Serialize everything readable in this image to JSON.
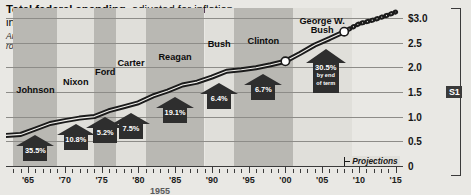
{
  "headline": {
    "bold_part": "Total federal spending,",
    "rest": " adjusted for inflation,",
    "line2": "in trillions"
  },
  "subnote": {
    "line1": "Arrows indicate amount that spending",
    "line2": "rose during each President’s term"
  },
  "axis": {
    "y_labels": [
      "$3.0",
      "2.5",
      "2.0",
      "1.5",
      "1.0",
      "0.5",
      "0"
    ],
    "y_values": [
      3.0,
      2.5,
      2.0,
      1.5,
      1.0,
      0.5,
      0
    ],
    "x_labels": [
      "'65",
      "'70",
      "'75",
      "'80",
      "'85",
      "'90",
      "'95",
      "'00",
      "'05",
      "'10",
      "'15"
    ],
    "x_values": [
      1965,
      1970,
      1975,
      1980,
      1985,
      1990,
      1995,
      2000,
      2005,
      2010,
      2015
    ]
  },
  "annotations": {
    "projections": "Projections",
    "section_label": "S1"
  },
  "colors": {
    "band_dark": "#b9b8b3",
    "band_light": "#e0dfda",
    "line": "#1b1b1b",
    "callout": "#2e2e2e",
    "background": "#e9e8e4"
  },
  "chart_data": {
    "type": "line",
    "title": "Total federal spending, adjusted for inflation, in trillions",
    "subtitle": "Arrows indicate amount that spending rose during each President's term",
    "xlabel": "",
    "ylabel": "Trillions of dollars",
    "xlim": [
      1962,
      2016
    ],
    "ylim": [
      0,
      3.2
    ],
    "grid": true,
    "legend": false,
    "x": [
      1962,
      1964,
      1966,
      1968,
      1970,
      1972,
      1974,
      1976,
      1978,
      1980,
      1982,
      1984,
      1986,
      1988,
      1990,
      1992,
      1994,
      1996,
      1998,
      2000,
      2002,
      2004,
      2006,
      2008,
      2010,
      2012,
      2014,
      2015
    ],
    "y": [
      0.62,
      0.64,
      0.75,
      0.86,
      0.92,
      0.97,
      1.0,
      1.12,
      1.2,
      1.28,
      1.42,
      1.52,
      1.64,
      1.7,
      1.8,
      1.92,
      1.95,
      1.99,
      2.05,
      2.12,
      2.28,
      2.45,
      2.58,
      2.72,
      2.88,
      2.96,
      3.06,
      3.12
    ],
    "projection_start_year": 2008,
    "presidents": [
      {
        "name": "Johnson",
        "pct": "35.5%",
        "start": 1963,
        "end": 1969,
        "band": "dark",
        "label_x": 1966.0,
        "label_y": 1.62,
        "arrow_x": 1966.0
      },
      {
        "name": "Nixon",
        "pct": "10.8%",
        "start": 1969,
        "end": 1974,
        "band": "light",
        "label_x": 1971.5,
        "label_y": 1.78,
        "arrow_x": 1971.5
      },
      {
        "name": "Ford",
        "pct": "5.2%",
        "start": 1974,
        "end": 1977,
        "band": "dark",
        "label_x": 1975.5,
        "label_y": 1.98,
        "arrow_x": 1975.5
      },
      {
        "name": "Carter",
        "pct": "7.5%",
        "start": 1977,
        "end": 1981,
        "band": "light",
        "label_x": 1979.0,
        "label_y": 2.16,
        "arrow_x": 1979.0
      },
      {
        "name": "Reagan",
        "pct": "19.1%",
        "start": 1981,
        "end": 1989,
        "band": "dark",
        "label_x": 1985.0,
        "label_y": 2.28,
        "arrow_x": 1985.0
      },
      {
        "name": "Bush",
        "pct": "6.4%",
        "start": 1989,
        "end": 1993,
        "band": "light",
        "label_x": 1991.0,
        "label_y": 2.55,
        "arrow_x": 1991.0
      },
      {
        "name": "Clinton",
        "pct": "6.7%",
        "start": 1993,
        "end": 2001,
        "band": "dark",
        "label_x": 1997.0,
        "label_y": 2.62,
        "arrow_x": 1997.0
      },
      {
        "name": "George W.\nBush",
        "pct": "30.5%",
        "sub": "by end\nof term",
        "start": 2001,
        "end": 2009,
        "band": "light",
        "label_x": 2005.0,
        "label_y": 3.02,
        "arrow_x": 2005.5
      }
    ]
  }
}
